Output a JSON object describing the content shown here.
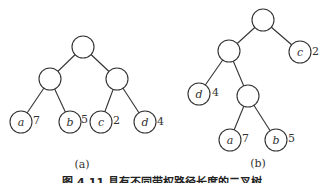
{
  "diagram": {
    "type": "binary-trees",
    "trees": [
      {
        "id": "a",
        "label": "(a)",
        "leaves": [
          {
            "name": "a",
            "weight": "7"
          },
          {
            "name": "b",
            "weight": "5"
          },
          {
            "name": "c",
            "weight": "2"
          },
          {
            "name": "d",
            "weight": "4"
          }
        ]
      },
      {
        "id": "b",
        "label": "(b)",
        "leaves": [
          {
            "name": "c",
            "weight": "2"
          },
          {
            "name": "d",
            "weight": "4"
          },
          {
            "name": "a",
            "weight": "7"
          },
          {
            "name": "b",
            "weight": "5"
          }
        ]
      }
    ],
    "caption": "图 4.11  具有不同带权路径长度的二叉树"
  }
}
